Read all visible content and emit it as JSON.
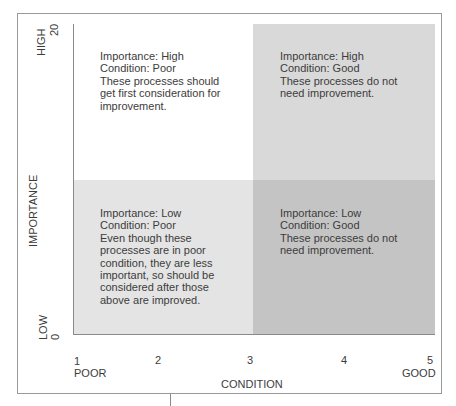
{
  "diagram": {
    "type": "quadrant-matrix",
    "y_axis": {
      "title": "IMPORTANCE",
      "high_label": "HIGH",
      "high_value": "20",
      "low_label": "LOW",
      "low_value": "0"
    },
    "x_axis": {
      "title": "CONDITION",
      "ticks": [
        "1",
        "2",
        "3",
        "4",
        "5"
      ],
      "poor_label": "POOR",
      "good_label": "GOOD"
    },
    "quadrants": [
      {
        "position": "top-left",
        "text": "Importance: High\nCondition: Poor\nThese processes should\nget first consideration for\nimprovement.",
        "fill": "#ffffff"
      },
      {
        "position": "top-right",
        "text": "Importance: High\nCondition: Good\nThese processes do not\nneed improvement.",
        "fill": "#d9d9d9"
      },
      {
        "position": "bottom-left",
        "text": "Importance: Low\nCondition: Poor\nEven though these\nprocesses are in poor\ncondition, they are less\nimportant, so should be\nconsidered after those\nabove are improved.",
        "fill": "#e4e4e4"
      },
      {
        "position": "bottom-right",
        "text": "Importance: Low\nCondition: Good\nThese processes do not\nneed improvement.",
        "fill": "#c4c4c4"
      }
    ]
  }
}
